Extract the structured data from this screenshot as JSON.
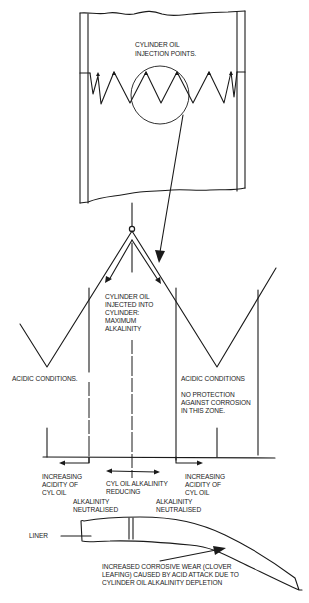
{
  "diagram": {
    "cylinder": {
      "label_lines": [
        "CYLINDER OIL",
        "INJECTION POINTS."
      ]
    },
    "center": {
      "label_lines": [
        "CYLINDER OIL",
        "INJECTED INTO",
        "CYLINDER:",
        "MAXIMUM",
        "ALKALINITY"
      ]
    },
    "left_zone": {
      "label_lines": [
        "ACIDIC CONDITIONS."
      ]
    },
    "right_zone": {
      "label_lines": [
        "ACIDIC CONDITIONS"
      ],
      "note_lines": [
        "NO PROTECTION",
        "AGAINST CORROSION",
        "IN THIS ZONE."
      ]
    },
    "bottom_labels": {
      "increasing_left": [
        "INCREASING",
        "ACIDITY OF",
        "CYL OIL"
      ],
      "increasing_right": [
        "INCREASING",
        "ACIDITY OF",
        "CYL OIL"
      ],
      "reducing": [
        "CYL OIL ALKALINITY",
        "REDUCING"
      ],
      "neutralised_left": [
        "ALKALINITY",
        "NEUTRALISED"
      ],
      "neutralised_right": [
        "ALKALINITY",
        "NEUTRALISED"
      ]
    },
    "liner": {
      "label": "LINER",
      "wear_lines": [
        "INCREASED CORROSIVE WEAR (CLOVER",
        "LEAFING) CAUSED BY ACID ATTACK DUE TO",
        "CYLINDER OIL ALKALINITY DEPLETION"
      ]
    }
  }
}
